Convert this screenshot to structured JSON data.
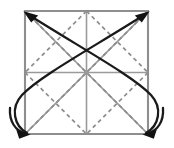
{
  "figure": {
    "canvas": {
      "width": 174,
      "height": 148,
      "background": "#ffffff"
    },
    "colors": {
      "sheet_edge": "#8e8e8e",
      "crease_solid": "#9a9a9a",
      "crease_dashed": "#8d8d8d",
      "fold_arrow": "#1a1a1a",
      "arrow_head": "#121212"
    },
    "sheet": {
      "name": "paper-square",
      "left": 25,
      "top": 11,
      "right": 148,
      "bottom": 134,
      "center_x": 86.5,
      "center_y": 72.5,
      "path": "M25,11 L148,11 L148,134 L25,134 Z"
    },
    "creases_solid": [
      {
        "name": "crease-vertical-center",
        "path": "M86.5,11 L86.5,134"
      },
      {
        "name": "crease-horizontal-center",
        "path": "M25,72.5 L148,72.5"
      },
      {
        "name": "crease-diagonal-tl-br",
        "path": "M25,11 L148,134"
      },
      {
        "name": "crease-diagonal-tr-bl",
        "path": "M148,11 L25,134"
      }
    ],
    "creases_dashed": [
      {
        "name": "crease-dashed-diamond-top-left",
        "path": "M86.5,11 L25,72.5"
      },
      {
        "name": "crease-dashed-diamond-top-right",
        "path": "M86.5,11 L148,72.5"
      },
      {
        "name": "crease-dashed-diamond-bottom-left",
        "path": "M25,72.5 L86.5,134"
      },
      {
        "name": "crease-dashed-diamond-bottom-right",
        "path": "M148,72.5 L86.5,134"
      },
      {
        "name": "crease-dashed-corner-tl-center",
        "path": "M25,11 L86.5,72.5"
      },
      {
        "name": "crease-dashed-corner-tr-center",
        "path": "M148,11 L86.5,72.5"
      },
      {
        "name": "crease-dashed-corner-bl-center",
        "path": "M25,134 L86.5,72.5"
      },
      {
        "name": "crease-dashed-corner-br-center",
        "path": "M148,134 L86.5,72.5"
      }
    ],
    "fold_arrows": [
      {
        "name": "fold-arrow-bottom-left-to-top-right",
        "from": "bottom-left corner",
        "to": "top-right corner",
        "path": "M27,133 C14,126 10,108 22,95 C40,76 92,48 144,15",
        "head": "M149.6,11.2 L134.8,15.6 L141.8,22.4 Z"
      },
      {
        "name": "fold-arrow-bottom-right-to-top-left",
        "from": "bottom-right corner",
        "to": "top-left corner",
        "path": "M146,133 C159,126 163,108 151,95 C133,76 81,48 29,15",
        "head": "M23.4,11.2 L38.2,15.6 L31.2,22.4 Z"
      },
      {
        "name": "fold-arrow-loop-head-bottom-left",
        "from": "outer loop left",
        "to": "bottom-left corner",
        "path": "M10,108 C9,122 16,131 25,133",
        "head": "M30.6,134.6 L16.2,129.4 L19.2,138.8 Z"
      },
      {
        "name": "fold-arrow-loop-head-bottom-right",
        "from": "outer loop right",
        "to": "bottom-right corner",
        "path": "M163,108 C164,122 157,131 148,133",
        "head": "M142.4,134.6 L156.8,129.4 L153.8,138.8 Z"
      }
    ]
  }
}
